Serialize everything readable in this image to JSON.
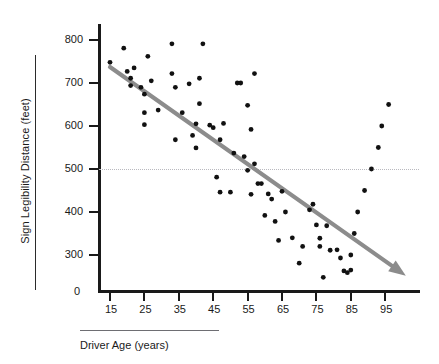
{
  "chart_data": {
    "type": "scatter",
    "title": "",
    "xlabel": "Driver Age (years)",
    "ylabel": "Sign Legibility Distance (feet)",
    "xlim": [
      10,
      103
    ],
    "ylim": [
      230,
      830
    ],
    "xticks": [
      15,
      25,
      35,
      45,
      55,
      65,
      75,
      85,
      95
    ],
    "yticks": [
      300,
      400,
      500,
      600,
      700,
      800
    ],
    "y_origin_label": "0",
    "grid": false,
    "legend": null,
    "reference_lines": [
      {
        "name": "legibility-500-feet",
        "axis": "y",
        "value": 500,
        "style": "dotted",
        "color": "#b9b9bf"
      }
    ],
    "trend_line": {
      "name": "regression-trend-arrow",
      "color": "#8c8c8c",
      "arrow_end": true,
      "x_start": 15,
      "y_start": 737,
      "x_end": 101,
      "y_end": 252
    },
    "point_color": "#111111",
    "x": [
      15,
      19,
      20,
      21,
      21,
      22,
      24,
      25,
      25,
      25,
      26,
      27,
      29,
      33,
      33,
      34,
      34,
      36,
      38,
      39,
      40,
      40,
      41,
      41,
      42,
      44,
      45,
      46,
      47,
      47,
      48,
      50,
      51,
      52,
      53,
      54,
      55,
      55,
      56,
      56,
      57,
      57,
      58,
      59,
      60,
      61,
      62,
      63,
      64,
      65,
      66,
      68,
      70,
      71,
      73,
      74,
      75,
      76,
      76,
      77,
      78,
      79,
      81,
      82,
      83,
      84,
      85,
      85,
      86,
      87,
      89,
      91,
      93,
      94,
      96
    ],
    "y": [
      748,
      781,
      727,
      711,
      694,
      735,
      690,
      674,
      631,
      603,
      762,
      705,
      637,
      791,
      722,
      690,
      568,
      631,
      698,
      578,
      605,
      549,
      711,
      652,
      791,
      602,
      596,
      481,
      446,
      568,
      606,
      446,
      537,
      700,
      700,
      529,
      497,
      648,
      441,
      592,
      722,
      512,
      466,
      466,
      392,
      442,
      430,
      378,
      334,
      448,
      400,
      340,
      281,
      320,
      405,
      418,
      370,
      339,
      320,
      248,
      368,
      311,
      312,
      293,
      263,
      259,
      265,
      300,
      350,
      400,
      450,
      500,
      550,
      600,
      650
    ]
  },
  "axis": {
    "y_tick_labels": [
      "800",
      "700",
      "600",
      "500",
      "400",
      "300"
    ],
    "x_tick_labels": [
      "15",
      "25",
      "35",
      "45",
      "55",
      "65",
      "75",
      "85",
      "95"
    ],
    "zero_label": "0"
  },
  "labels": {
    "y_title": "Sign Legibility Distance (feet)",
    "x_title": "Driver Age (years)"
  }
}
